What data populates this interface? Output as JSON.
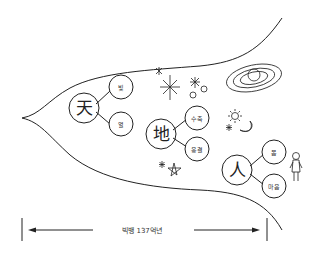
{
  "diagram": {
    "groups": [
      {
        "id": "heaven",
        "label": "天",
        "children": [
          {
            "label": "빛"
          },
          {
            "label": "열"
          }
        ]
      },
      {
        "id": "earth",
        "label": "地",
        "children": [
          {
            "label": "수축"
          },
          {
            "label": "응결"
          }
        ]
      },
      {
        "id": "human",
        "label": "人",
        "children": [
          {
            "label": "몸"
          },
          {
            "label": "마음"
          }
        ]
      }
    ],
    "timeline": {
      "label": "빅뱅 137억년"
    },
    "decorations": [
      "star-icon",
      "sparkle-icon",
      "flower-star-icon",
      "planet-icon",
      "sun-icon",
      "moon-icon",
      "star-outline-icon",
      "stick-figure-icon"
    ],
    "colors": {
      "ink": "#222222",
      "background": "#ffffff"
    }
  }
}
